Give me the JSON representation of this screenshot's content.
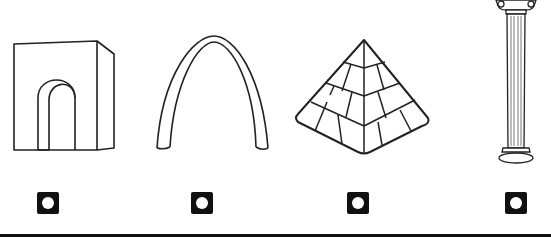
{
  "question": {
    "type": "image-choice",
    "options": [
      {
        "id": "a",
        "icon": "arch-gateway-icon",
        "description": "Block arch / gateway"
      },
      {
        "id": "b",
        "icon": "gateway-arch-icon",
        "description": "Catenary arch"
      },
      {
        "id": "c",
        "icon": "pyramid-icon",
        "description": "Stepped pyramid"
      },
      {
        "id": "d",
        "icon": "greek-column-icon",
        "description": "Ionic column"
      }
    ],
    "selected": null
  },
  "colors": {
    "line": "#222222",
    "radio_fill": "#111111",
    "background": "#ffffff"
  }
}
